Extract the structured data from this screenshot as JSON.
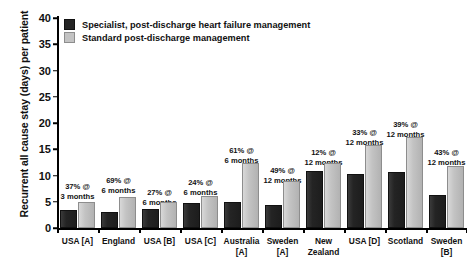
{
  "chart_data": {
    "type": "bar",
    "title": "",
    "xlabel": "",
    "ylabel": "Recurrent all cause stay (days) per patient",
    "ylim": [
      0,
      40
    ],
    "yticks": [
      0,
      5,
      10,
      15,
      20,
      25,
      30,
      35,
      40
    ],
    "grid": false,
    "legend_position": "top-left",
    "categories": [
      "USA [A]",
      "England",
      "USA [B]",
      "USA [C]",
      "Australia [A]",
      "Sweden [A]",
      "New Zealand",
      "USA [D]",
      "Scotland",
      "Sweden [B]"
    ],
    "category_lines": [
      [
        "USA [A]",
        ""
      ],
      [
        "England",
        ""
      ],
      [
        "USA [B]",
        ""
      ],
      [
        "USA [C]",
        ""
      ],
      [
        "Australia",
        "[A]"
      ],
      [
        "Sweden",
        "[A]"
      ],
      [
        "New",
        "Zealand"
      ],
      [
        "USA [D]",
        ""
      ],
      [
        "Scotland",
        ""
      ],
      [
        "Sweden",
        "[B]"
      ]
    ],
    "series": [
      {
        "name": "Specialist, post-discharge heart failure management",
        "color": "#242424",
        "values": [
          3.0,
          2.7,
          3.2,
          4.3,
          4.5,
          4.0,
          10.5,
          10.0,
          10.2,
          6.0
        ]
      },
      {
        "name": "Standard post-discharge management",
        "color": "#c3c3c3",
        "values": [
          4.5,
          5.5,
          4.5,
          5.8,
          12.0,
          8.5,
          12.0,
          15.5,
          17.0,
          11.5
        ]
      }
    ],
    "annotations": [
      {
        "line1": "37% @",
        "line2": "3 months"
      },
      {
        "line1": "69% @",
        "line2": "6 months"
      },
      {
        "line1": "27% @",
        "line2": "6 months"
      },
      {
        "line1": "24% @",
        "line2": "6 months"
      },
      {
        "line1": "61% @",
        "line2": "6 months"
      },
      {
        "line1": "49% @",
        "line2": "12 months"
      },
      {
        "line1": "12% @",
        "line2": "12 months"
      },
      {
        "line1": "33% @",
        "line2": "12 months"
      },
      {
        "line1": "39% @",
        "line2": "12 months"
      },
      {
        "line1": "43% @",
        "line2": "12 months"
      }
    ],
    "annotation_offsets": [
      26,
      32,
      20,
      30,
      62,
      42,
      60,
      80,
      88,
      60
    ]
  },
  "legend": {
    "items": [
      {
        "label": "Specialist, post-discharge heart failure management",
        "swatch": "dark"
      },
      {
        "label": "Standard post-discharge management",
        "swatch": "light"
      }
    ]
  }
}
